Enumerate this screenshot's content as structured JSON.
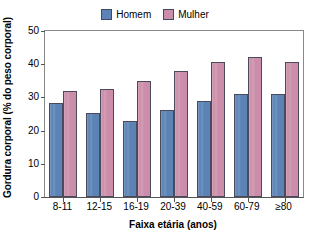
{
  "chart_data": {
    "type": "bar",
    "title": "",
    "xlabel": "Faixa etária (anos)",
    "ylabel": "Gordura corporal (% do peso corporal)",
    "categories": [
      "8-11",
      "12-15",
      "16-19",
      "20-39",
      "40-59",
      "60-79",
      "≥80"
    ],
    "series": [
      {
        "name": "Homem",
        "color": "#5b83b5",
        "values": [
          28.3,
          25.3,
          23.0,
          26.2,
          28.8,
          31.0,
          30.9
        ]
      },
      {
        "name": "Mulher",
        "color": "#cb8da9",
        "values": [
          32.0,
          32.6,
          35.0,
          37.9,
          40.6,
          42.3,
          40.6
        ]
      }
    ],
    "ylim": [
      0,
      50
    ],
    "yticks": [
      0,
      10,
      20,
      30,
      40,
      50
    ],
    "ytick_labels": [
      "0",
      "10",
      "20",
      "30",
      "40",
      "50"
    ],
    "grid": false,
    "legend_position": "top-center",
    "bar_edge_color": "#4a4a5c",
    "axis_color": "#555555"
  }
}
